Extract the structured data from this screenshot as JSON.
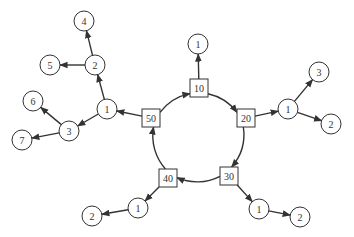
{
  "diagram": {
    "type": "tree-ring",
    "ring_nodes": [
      {
        "id": "r10",
        "label": "10",
        "x": 199,
        "y": 88
      },
      {
        "id": "r20",
        "label": "20",
        "x": 246,
        "y": 118
      },
      {
        "id": "r30",
        "label": "30",
        "x": 229,
        "y": 176
      },
      {
        "id": "r40",
        "label": "40",
        "x": 168,
        "y": 178
      },
      {
        "id": "r50",
        "label": "50",
        "x": 151,
        "y": 118
      }
    ],
    "circle_nodes": [
      {
        "id": "a1",
        "label": "1",
        "x": 198,
        "y": 44
      },
      {
        "id": "b1",
        "label": "1",
        "x": 288,
        "y": 109
      },
      {
        "id": "b3",
        "label": "3",
        "x": 319,
        "y": 72
      },
      {
        "id": "b2",
        "label": "2",
        "x": 331,
        "y": 124
      },
      {
        "id": "c1",
        "label": "1",
        "x": 259,
        "y": 209
      },
      {
        "id": "c2",
        "label": "2",
        "x": 300,
        "y": 217
      },
      {
        "id": "d1",
        "label": "1",
        "x": 138,
        "y": 208
      },
      {
        "id": "d2",
        "label": "2",
        "x": 92,
        "y": 216
      },
      {
        "id": "e1",
        "label": "1",
        "x": 107,
        "y": 109
      },
      {
        "id": "e2",
        "label": "2",
        "x": 95,
        "y": 65
      },
      {
        "id": "e4",
        "label": "4",
        "x": 84,
        "y": 21
      },
      {
        "id": "e5",
        "label": "5",
        "x": 50,
        "y": 65
      },
      {
        "id": "e3",
        "label": "3",
        "x": 69,
        "y": 131
      },
      {
        "id": "e6",
        "label": "6",
        "x": 33,
        "y": 101
      },
      {
        "id": "e7",
        "label": "7",
        "x": 22,
        "y": 140
      }
    ],
    "ring_edges": [
      {
        "from": "r50",
        "to": "r10"
      },
      {
        "from": "r10",
        "to": "r20"
      },
      {
        "from": "r20",
        "to": "r30"
      },
      {
        "from": "r30",
        "to": "r40"
      },
      {
        "from": "r40",
        "to": "r50"
      }
    ],
    "tree_edges": [
      {
        "from": "r10",
        "to": "a1"
      },
      {
        "from": "r20",
        "to": "b1"
      },
      {
        "from": "b1",
        "to": "b3"
      },
      {
        "from": "b1",
        "to": "b2"
      },
      {
        "from": "r30",
        "to": "c1"
      },
      {
        "from": "c1",
        "to": "c2"
      },
      {
        "from": "r40",
        "to": "d1"
      },
      {
        "from": "d1",
        "to": "d2"
      },
      {
        "from": "r50",
        "to": "e1"
      },
      {
        "from": "e1",
        "to": "e2"
      },
      {
        "from": "e2",
        "to": "e4"
      },
      {
        "from": "e2",
        "to": "e5"
      },
      {
        "from": "e1",
        "to": "e3"
      },
      {
        "from": "e3",
        "to": "e6"
      },
      {
        "from": "e3",
        "to": "e7"
      }
    ]
  }
}
